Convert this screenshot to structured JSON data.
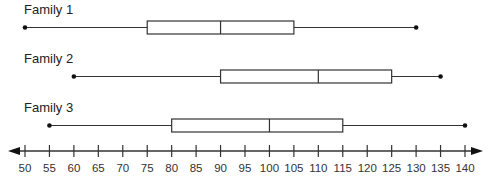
{
  "chart_data": {
    "type": "boxplot",
    "title": "",
    "xlabel": "",
    "ylabel": "",
    "xlim": [
      50,
      140
    ],
    "tick_step": 5,
    "ticks": [
      50,
      55,
      60,
      65,
      70,
      75,
      80,
      85,
      90,
      95,
      100,
      105,
      110,
      115,
      120,
      125,
      130,
      135,
      140
    ],
    "grid": false,
    "axis_arrows": true,
    "series": [
      {
        "name": "Family 1",
        "min": 50,
        "q1": 75,
        "median": 90,
        "q3": 105,
        "max": 130
      },
      {
        "name": "Family 2",
        "min": 60,
        "q1": 90,
        "median": 110,
        "q3": 125,
        "max": 135
      },
      {
        "name": "Family 3",
        "min": 55,
        "q1": 80,
        "median": 100,
        "q3": 115,
        "max": 140
      }
    ]
  },
  "colors": {
    "line": "#333333",
    "box_fill": "#ffffff",
    "text": "#222222"
  }
}
